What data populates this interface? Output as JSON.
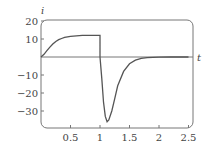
{
  "chart_data": {
    "type": "line",
    "title": "",
    "xlabel": "t",
    "ylabel": "i",
    "xlim": [
      0,
      2.5
    ],
    "ylim": [
      -40,
      20
    ],
    "xticks": [
      0.5,
      1,
      1.5,
      2,
      2.5
    ],
    "xtick_labels": [
      "0.5",
      "1",
      "1.5",
      "2",
      "2.5"
    ],
    "yticks": [
      20,
      10,
      -10,
      -20,
      -30
    ],
    "ytick_labels": [
      "20",
      "10",
      "−10",
      "−20",
      "−30"
    ],
    "grid": false,
    "series": [
      {
        "name": "i(t)",
        "x": [
          0,
          0.05,
          0.1,
          0.15,
          0.2,
          0.25,
          0.3,
          0.35,
          0.4,
          0.5,
          0.6,
          0.7,
          0.8,
          0.9,
          1.0,
          1.0,
          1.03,
          1.06,
          1.09,
          1.12,
          1.15,
          1.2,
          1.25,
          1.3,
          1.4,
          1.5,
          1.6,
          1.7,
          1.8,
          2.0,
          2.2,
          2.5
        ],
        "values": [
          0,
          1.5,
          3.5,
          5.5,
          7.2,
          8.6,
          9.6,
          10.3,
          10.9,
          11.5,
          11.8,
          12.0,
          12.0,
          12.0,
          12.0,
          0,
          -12,
          -25,
          -33,
          -36,
          -35,
          -30,
          -23,
          -16,
          -8,
          -3.8,
          -1.8,
          -0.8,
          -0.4,
          -0.1,
          0,
          0
        ]
      }
    ],
    "zero_line": 0
  },
  "colors": {
    "line": "#555555",
    "frame": "#777777",
    "text": "#444444"
  }
}
